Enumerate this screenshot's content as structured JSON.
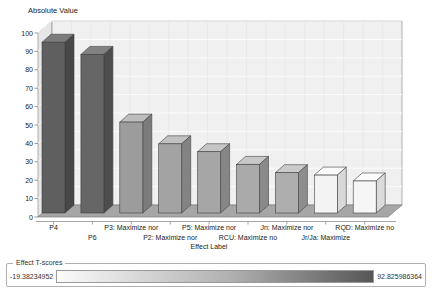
{
  "chart_data": {
    "type": "bar",
    "title": "Absolute Value",
    "xlabel": "Effect Label",
    "ylabel": "Absolute Value",
    "ylim": [
      0,
      100
    ],
    "yticks": [
      0,
      10,
      20,
      30,
      40,
      50,
      60,
      70,
      80,
      90,
      100
    ],
    "grid": true,
    "projection": "3d",
    "legend_position": "bottom",
    "categories": [
      "P4",
      "P6",
      "P3: Maximize nor",
      "P2: Maximize nor",
      "P5: Maximize nor",
      "RCU: Maximize no",
      "Jn: Maximize nor",
      "Jr/Ja: Maximize",
      "RQD: Maximize no"
    ],
    "values": [
      92.8,
      86.2,
      49.4,
      37.6,
      33.3,
      26.4,
      21.9,
      20.6,
      17.4
    ],
    "label_rows": [
      1,
      2,
      1,
      2,
      1,
      2,
      1,
      2,
      1
    ],
    "bar_colors": [
      {
        "front": "#5f5f5f",
        "top": "#7c7c7c",
        "side": "#474747"
      },
      {
        "front": "#666666",
        "top": "#828282",
        "side": "#4d4d4d"
      },
      {
        "front": "#9c9c9c",
        "top": "#bdbdbd",
        "side": "#7b7b7b"
      },
      {
        "front": "#a3a3a3",
        "top": "#c2c2c2",
        "side": "#838383"
      },
      {
        "front": "#a6a6a6",
        "top": "#c5c5c5",
        "side": "#868686"
      },
      {
        "front": "#aaaaaa",
        "top": "#c8c8c8",
        "side": "#8a8a8a"
      },
      {
        "front": "#aeaeae",
        "top": "#cbcbcb",
        "side": "#8e8e8e"
      },
      {
        "front": "#f3f3f3",
        "top": "#fafafa",
        "side": "#d8d8d8"
      },
      {
        "front": "#f6f6f6",
        "top": "#fbfbfb",
        "side": "#dbdbdb"
      }
    ],
    "wall_color": "#f0f0f0",
    "left_wall_color": "#e7e7e7",
    "floor_color": "#a6a6a6",
    "gridline_color": "#fbfbfb",
    "vgridline_color": "#e2e2e2",
    "edge_color": "#909090",
    "text_color": "#222222"
  },
  "legend": {
    "title": "Effect T-scores",
    "min_label": "-19.38234952",
    "max_label": "92.825986364",
    "gradient_from": "#fbfbfb",
    "gradient_mid": "#b0b0b0",
    "gradient_to": "#565656"
  }
}
